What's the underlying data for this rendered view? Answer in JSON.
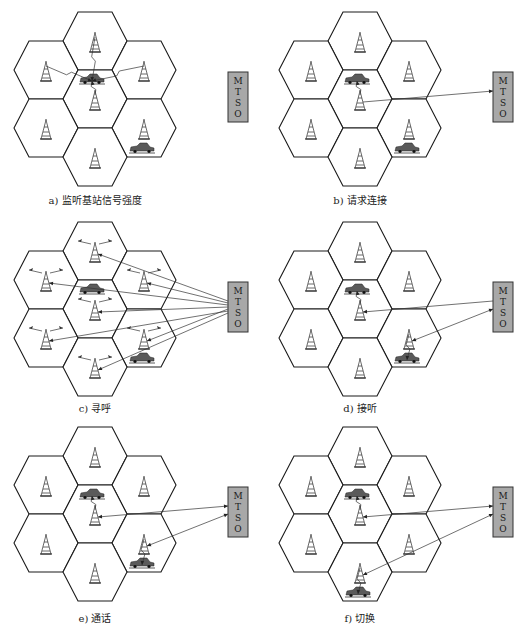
{
  "figure": {
    "mtso_label": [
      "M",
      "T",
      "S",
      "O"
    ],
    "panels": [
      {
        "id": "a",
        "caption": "a) 监听基站信号强度",
        "towers_with_waves": false,
        "cars": [
          {
            "cell": "center",
            "pos": "top"
          },
          {
            "cell": "right-lower",
            "pos": "bottom"
          }
        ],
        "radio_links": [
          {
            "from": "car:center-top",
            "to": "tower:top"
          },
          {
            "from": "car:center-top",
            "to": "tower:left-upper"
          },
          {
            "from": "car:center-top",
            "to": "tower:right-upper"
          },
          {
            "from": "car:center-top",
            "to": "tower:center"
          }
        ],
        "mtso_links": []
      },
      {
        "id": "b",
        "caption": "b) 请求连接",
        "towers_with_waves": false,
        "cars": [
          {
            "cell": "center",
            "pos": "top"
          },
          {
            "cell": "right-lower",
            "pos": "bottom"
          }
        ],
        "radio_links": [
          {
            "from": "car:center-top",
            "to": "tower:center"
          }
        ],
        "mtso_links": [
          {
            "from": "tower:center",
            "to": "mtso",
            "arrow": "to-mtso"
          }
        ]
      },
      {
        "id": "c",
        "caption": "c) 寻呼",
        "towers_with_waves": true,
        "cars": [
          {
            "cell": "center",
            "pos": "top"
          },
          {
            "cell": "right-lower",
            "pos": "bottom"
          }
        ],
        "radio_links": [],
        "mtso_links": [
          {
            "from": "mtso",
            "to": "tower:top",
            "arrow": "to-tower"
          },
          {
            "from": "mtso",
            "to": "tower:right-upper",
            "arrow": "to-tower"
          },
          {
            "from": "mtso",
            "to": "tower:left-upper",
            "arrow": "to-tower"
          },
          {
            "from": "mtso",
            "to": "tower:center",
            "arrow": "to-tower"
          },
          {
            "from": "mtso",
            "to": "tower:right-lower",
            "arrow": "to-tower"
          },
          {
            "from": "mtso",
            "to": "tower:left-lower",
            "arrow": "to-tower"
          },
          {
            "from": "mtso",
            "to": "tower:bottom",
            "arrow": "to-tower"
          }
        ]
      },
      {
        "id": "d",
        "caption": "d) 接听",
        "towers_with_waves": false,
        "cars": [
          {
            "cell": "center",
            "pos": "top"
          },
          {
            "cell": "right-lower",
            "pos": "bottom"
          }
        ],
        "radio_links": [
          {
            "from": "car:center-top",
            "to": "tower:center"
          },
          {
            "from": "car:right-lower-bottom",
            "to": "tower:right-lower"
          }
        ],
        "mtso_links": [
          {
            "from": "mtso",
            "to": "tower:center",
            "arrow": "to-tower"
          },
          {
            "from": "tower:right-lower",
            "to": "mtso",
            "arrow": "both"
          }
        ]
      },
      {
        "id": "e",
        "caption": "e) 通话",
        "towers_with_waves": false,
        "cars": [
          {
            "cell": "center",
            "pos": "top"
          },
          {
            "cell": "right-lower",
            "pos": "bottom"
          }
        ],
        "radio_links": [
          {
            "from": "car:center-top",
            "to": "tower:center"
          },
          {
            "from": "car:right-lower-bottom",
            "to": "tower:right-lower"
          }
        ],
        "mtso_links": [
          {
            "from": "tower:center",
            "to": "mtso",
            "arrow": "both"
          },
          {
            "from": "tower:right-lower",
            "to": "mtso",
            "arrow": "both"
          }
        ]
      },
      {
        "id": "f",
        "caption": "f) 切换",
        "towers_with_waves": false,
        "cars": [
          {
            "cell": "center",
            "pos": "top"
          },
          {
            "cell": "bottom",
            "pos": "bottom"
          }
        ],
        "radio_links": [
          {
            "from": "car:center-top",
            "to": "tower:center"
          },
          {
            "from": "car:bottom-bottom",
            "to": "tower:bottom"
          }
        ],
        "mtso_links": [
          {
            "from": "tower:center",
            "to": "mtso",
            "arrow": "both"
          },
          {
            "from": "tower:bottom",
            "to": "mtso",
            "arrow": "both"
          }
        ]
      }
    ]
  }
}
